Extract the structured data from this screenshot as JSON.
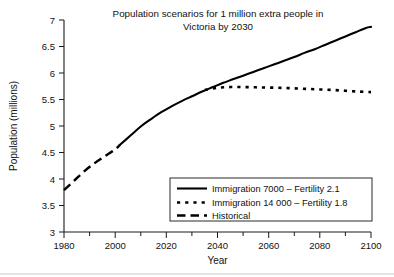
{
  "chart_data": {
    "type": "line",
    "title": "Population scenarios for 1 million extra people in Victoria by 2030",
    "title_line1": "Population scenarios for 1 million extra people in",
    "title_line2": "Victoria by 2030",
    "xlabel": "Year",
    "ylabel": "Population (millions)",
    "xlim": [
      1980,
      2100
    ],
    "ylim": [
      3,
      7
    ],
    "grid": false,
    "legend_position": "lower right",
    "x_ticks": [
      1980,
      2000,
      2020,
      2040,
      2060,
      2080,
      2100
    ],
    "x_tick_labels": [
      "1980",
      "2000",
      "2020",
      "2040",
      "2060",
      "2080",
      "2100"
    ],
    "x_minor_ticks": [
      1990,
      2010,
      2030,
      2050,
      2070,
      2090
    ],
    "y_ticks": [
      3,
      3.5,
      4,
      4.5,
      5,
      5.5,
      6,
      6.5,
      7
    ],
    "y_tick_labels": [
      "3",
      "3.5",
      "4",
      "4.5",
      "5",
      "5.5",
      "6",
      "6.5",
      "7"
    ],
    "series": [
      {
        "name": "Immigration 7000 – Fertility 2.1",
        "style": "solid",
        "x": [
          2002,
          2006,
          2010,
          2014,
          2018,
          2022,
          2026,
          2030,
          2034,
          2038,
          2042,
          2046,
          2050,
          2054,
          2058,
          2062,
          2066,
          2070,
          2074,
          2078,
          2082,
          2086,
          2090,
          2094,
          2098,
          2100
        ],
        "values": [
          4.65,
          4.82,
          4.99,
          5.13,
          5.26,
          5.37,
          5.47,
          5.56,
          5.65,
          5.73,
          5.81,
          5.88,
          5.95,
          6.02,
          6.09,
          6.16,
          6.23,
          6.3,
          6.38,
          6.45,
          6.53,
          6.61,
          6.69,
          6.77,
          6.85,
          6.87
        ]
      },
      {
        "name": "Immigration 14 000 – Fertility 1.8",
        "style": "dotted",
        "x": [
          2035,
          2040,
          2045,
          2050,
          2055,
          2060,
          2065,
          2070,
          2075,
          2080,
          2085,
          2090,
          2095,
          2100
        ],
        "values": [
          5.68,
          5.72,
          5.735,
          5.735,
          5.73,
          5.725,
          5.72,
          5.71,
          5.7,
          5.69,
          5.68,
          5.665,
          5.65,
          5.64
        ]
      },
      {
        "name": "Historical",
        "style": "dashed",
        "x": [
          1980,
          1984,
          1988,
          1992,
          1996,
          2000,
          2002
        ],
        "values": [
          3.79,
          3.97,
          4.15,
          4.3,
          4.43,
          4.56,
          4.65
        ]
      }
    ],
    "legend_entries": [
      {
        "label": "Immigration 7000 – Fertility 2.1",
        "style": "solid"
      },
      {
        "label": "Immigration 14 000 – Fertility 1.8",
        "style": "dotted"
      },
      {
        "label": "Historical",
        "style": "dashed"
      }
    ],
    "colors": {
      "series": "#000000",
      "axis": "#1a1a1a",
      "background": "#ffffff"
    }
  }
}
